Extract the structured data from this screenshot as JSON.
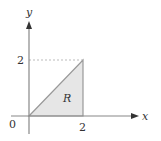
{
  "diagram": {
    "type": "coordinate-region",
    "axes": {
      "x_label": "x",
      "y_label": "y",
      "origin_label": "0",
      "x_tick_label": "2",
      "y_tick_label": "2"
    },
    "region": {
      "label": "R",
      "vertices": [
        [
          0,
          0
        ],
        [
          2,
          0
        ],
        [
          2,
          2
        ]
      ],
      "description": "Triangle bounded by y = x, x = 2, and y = 0"
    },
    "guides": {
      "dashed_line": "from (0,2) to (2,2)"
    },
    "colors": {
      "axis": "#888888",
      "region_fill": "#e6e6e6",
      "region_stroke": "#999999",
      "dash": "#aaaaaa",
      "text": "#333333"
    }
  }
}
